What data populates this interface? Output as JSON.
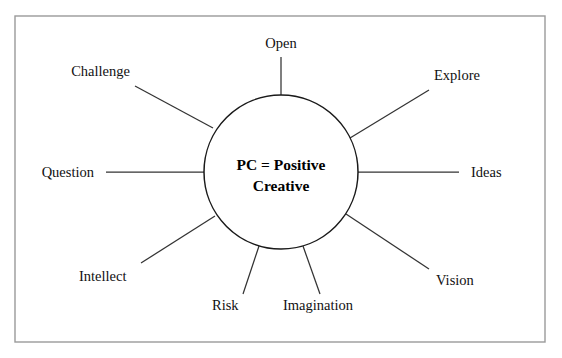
{
  "diagram": {
    "type": "radial-spoke-diagram",
    "background_color": "#ffffff",
    "frame": {
      "name": "border-frame",
      "x": 15,
      "y": 16,
      "width": 530,
      "height": 326,
      "stroke_color": "#9a9a9a"
    },
    "hub": {
      "center_x": 281,
      "center_y": 172,
      "radius": 77,
      "stroke_color": "#1a1a1a",
      "fill_color": "#ffffff",
      "label_line_1": "PC = Positive",
      "label_line_2": "Creative"
    },
    "spokes": [
      {
        "label": "Open",
        "angle_deg": -90,
        "line_x1": 281,
        "line_y1": 95,
        "line_x2": 281,
        "line_y2": 57,
        "text_x": 281,
        "text_y": 48,
        "anchor": "middle"
      },
      {
        "label": "Explore",
        "angle_deg": -26,
        "line_x1": 350,
        "line_y1": 138,
        "line_x2": 429,
        "line_y2": 90,
        "text_x": 434,
        "text_y": 80,
        "anchor": "start"
      },
      {
        "label": "Ideas",
        "angle_deg": 0,
        "line_x1": 358,
        "line_y1": 172,
        "line_x2": 459,
        "line_y2": 172,
        "text_x": 471,
        "text_y": 177,
        "anchor": "start"
      },
      {
        "label": "Vision",
        "angle_deg": 33,
        "line_x1": 346,
        "line_y1": 214,
        "line_x2": 429,
        "line_y2": 269,
        "text_x": 436,
        "text_y": 285,
        "anchor": "start"
      },
      {
        "label": "Imagination",
        "angle_deg": 73,
        "line_x1": 303,
        "line_y1": 246,
        "line_x2": 320,
        "line_y2": 294,
        "text_x": 283,
        "text_y": 310,
        "anchor": "start"
      },
      {
        "label": "Risk",
        "angle_deg": 107,
        "line_x1": 259,
        "line_y1": 246,
        "line_x2": 243,
        "line_y2": 294,
        "text_x": 212,
        "text_y": 310,
        "anchor": "start"
      },
      {
        "label": "Intellect",
        "angle_deg": 150,
        "line_x1": 215,
        "line_y1": 216,
        "line_x2": 141,
        "line_y2": 263,
        "text_x": 79,
        "text_y": 281,
        "anchor": "start"
      },
      {
        "label": "Question",
        "angle_deg": 180,
        "line_x1": 204,
        "line_y1": 172,
        "line_x2": 106,
        "line_y2": 172,
        "text_x": 94,
        "text_y": 177,
        "anchor": "end"
      },
      {
        "label": "Challenge",
        "angle_deg": -152,
        "line_x1": 213,
        "line_y1": 128,
        "line_x2": 135,
        "line_y2": 86,
        "text_x": 130,
        "text_y": 76,
        "anchor": "end"
      }
    ]
  }
}
